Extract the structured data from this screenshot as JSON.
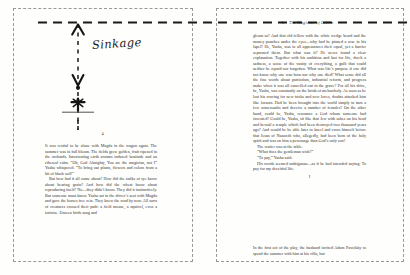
{
  "document": {
    "type": "book-spread-scan",
    "annotation_label": "Sinkage",
    "colors": {
      "paper": "#fefefd",
      "ink": "#33302a",
      "annotation": "#1e1c19",
      "crop_guide": "#9a9a94"
    }
  },
  "left_page": {
    "folio": "4",
    "paragraphs": [
      "It was restful to be alone with Magda in the wagon again. The summer was in full bloom. The fields grew golden, fruit ripened in the orchards. Intoxicating earth aromas induced lassitude and an ethereal calm. “Oh, God Almighty, You are the magician, not I” Yasha whispered. “To bring out plants, flowers and colors from a bit of black soil!”",
      "But how had it all come about? How did the stalks of rye know about bearing grain? And how did the wheat know about reproducing itself? No—they didn’t know. They did it instinctively. But someone must know. Yasha sat in the driver’s seat with Magda and gave the horses free rein. They knew the road by now. All sorts of creatures crossed their path: a field mouse, a squirrel, even a tortoise. Unseen birds sang and"
    ]
  },
  "right_page": {
    "folio": "5",
    "running_head": "The Magician of Lublin",
    "paragraphs": [
      "gleam so? And that old fellow with the white wedge beard and the money pouches under the eyes—why had he pinned a rose in his lapel? He, Yasha, was to all appearances their equal, yet a barrier separated them. But what was it? He never found a clear explanation. Together with his ambition and lust for life, dwelt a sadness, a sense of the vanity of everything, a guilt that could neither be repaid nor forgotten. What was life’s purpose if one did not know why one was born nor why one died? What sense did all the fine words about patriotism, industrial reform, and progress make when it was all cancelled out in the grave? For all his drive, he, Yasha, was constantly on the brink of melancholy. As soon as he lost his craving for new tricks and new loves, doubts attacked him like locusts. Had he been brought into the world simply to turn a few somersaults and deceive a number of females? On the other hand, could he, Yasha, renounce a God whom someone had invented? Could he, Yasha, sit like that Jew with ashes on his head and bewail a temple which had been destroyed two thousand years ago? And would he be able later to kneel and cross himself before that Jesus of Nazareth who, allegedly, had been born of the holy spirit and was on him a personage than God’s only son?",
      "The waiter was at the table.",
      "“What does the gentleman wish?”",
      "“To pay,” Yasha said.",
      "His words seemed ambiguous—as if he had intended saying: To pay for my deceitful life."
    ],
    "section_break": "I",
    "paragraphs_after_break": [
      "In the first act of the play, the husband invited Adam Povolsky to spend the summer with him at his villa, but"
    ]
  },
  "annotation": {
    "label": "Sinkage",
    "measure_target_folio": "4",
    "elements": [
      "top-dashed-horizontal-rule",
      "vertical-dashed-measure-line",
      "up-arrow-head",
      "down-arrow-head",
      "endpoint-dot",
      "folio-marker"
    ]
  }
}
